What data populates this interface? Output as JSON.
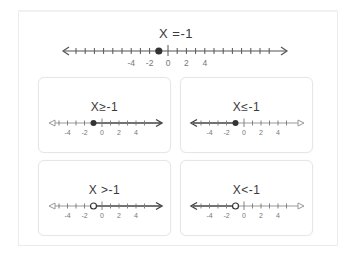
{
  "main": {
    "title": "X =-1",
    "tick_labels": [
      "-4",
      "-2",
      "0",
      "2",
      "4"
    ],
    "point": {
      "value": -1,
      "style": "closed"
    }
  },
  "cards": [
    {
      "title": "X≥-1",
      "point_value": -1,
      "point_style": "closed",
      "shade": "right"
    },
    {
      "title": "X≤-1",
      "point_value": -1,
      "point_style": "closed",
      "shade": "left"
    },
    {
      "title": "X >-1",
      "point_value": -1,
      "point_style": "open",
      "shade": "right"
    },
    {
      "title": "X<-1",
      "point_value": -1,
      "point_style": "open",
      "shade": "left"
    }
  ],
  "card_tick_labels": [
    "-4",
    "-2",
    "0",
    "2",
    "4"
  ],
  "colors": {
    "line": "#555555",
    "point": "#333333",
    "frame": "#ececec",
    "card_border": "#e6e6e6"
  }
}
